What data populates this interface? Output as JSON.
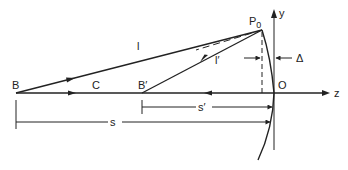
{
  "diagram": {
    "type": "optics-mirror-geometry",
    "colors": {
      "stroke": "#222222",
      "background": "#ffffff"
    },
    "points": {
      "B": {
        "label": "B"
      },
      "C": {
        "label": "C"
      },
      "B_prime": {
        "label": "B′"
      },
      "P0": {
        "label": "P",
        "subscript": "0"
      },
      "O": {
        "label": "O"
      }
    },
    "axes": {
      "z": {
        "label": "z"
      },
      "y": {
        "label": "y"
      }
    },
    "rays": {
      "incident": {
        "label": "l"
      },
      "reflected": {
        "label": "l′"
      }
    },
    "dimensions": {
      "sag": {
        "label": "Δ"
      },
      "image_distance": {
        "label": "s′"
      },
      "object_distance": {
        "label": "s"
      }
    }
  }
}
